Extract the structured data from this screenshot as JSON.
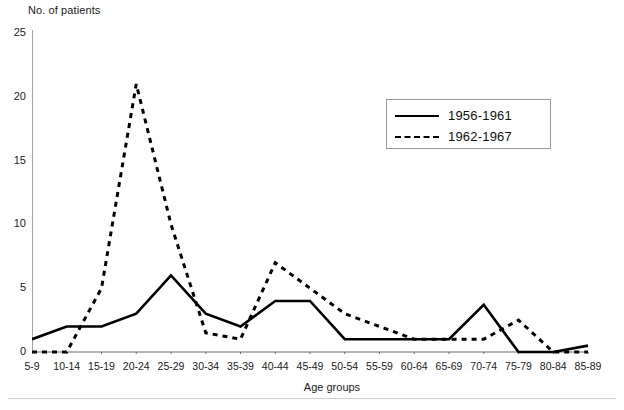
{
  "chart_data": {
    "type": "line",
    "title": "",
    "ylabel": "No. of patients",
    "xlabel": "Age groups",
    "ylim": [
      0,
      25
    ],
    "yticks": [
      0,
      5,
      10,
      15,
      20,
      25
    ],
    "grid": false,
    "legend_position": "upper-right",
    "categories": [
      "5-9",
      "10-14",
      "15-19",
      "20-24",
      "25-29",
      "30-34",
      "35-39",
      "40-44",
      "45-49",
      "50-54",
      "55-59",
      "60-64",
      "65-69",
      "70-74",
      "75-79",
      "80-84",
      "85-89"
    ],
    "series": [
      {
        "name": "1956-1961",
        "style": "solid",
        "color": "#000000",
        "values": [
          1,
          2,
          2,
          3,
          6,
          3,
          2,
          4,
          4,
          1,
          1,
          1,
          1,
          3.7,
          0,
          0,
          0.5
        ]
      },
      {
        "name": "1962-1967",
        "style": "dashed",
        "color": "#000000",
        "values": [
          0,
          0,
          5,
          21,
          10,
          1.5,
          1,
          7,
          5,
          3,
          2,
          1,
          1,
          1,
          2.5,
          0,
          0
        ]
      }
    ]
  },
  "legend": {
    "entries": [
      {
        "label": "1956-1961",
        "style": "solid"
      },
      {
        "label": "1962-1967",
        "style": "dashed"
      }
    ]
  },
  "caption": ""
}
